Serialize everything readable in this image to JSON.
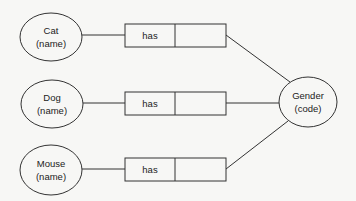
{
  "diagram": {
    "type": "entity-relationship",
    "stroke_color": "#333333",
    "background": "#f7f7f5",
    "entities": [
      {
        "id": "cat",
        "name": "Cat",
        "qualifier": "(name)",
        "cx": 51,
        "cy": 37,
        "rx": 31,
        "ry": 24
      },
      {
        "id": "dog",
        "name": "Dog",
        "qualifier": "(name)",
        "cx": 52,
        "cy": 104,
        "rx": 31,
        "ry": 24
      },
      {
        "id": "mouse",
        "name": "Mouse",
        "qualifier": "(name)",
        "cx": 51,
        "cy": 170,
        "rx": 31,
        "ry": 25
      }
    ],
    "target": {
      "id": "gender",
      "name": "Gender",
      "qualifier": "(code)",
      "cx": 308,
      "cy": 102,
      "rx": 29,
      "ry": 25
    },
    "relationships": [
      {
        "from": "cat",
        "to": "gender",
        "label": "has",
        "box_y": 24
      },
      {
        "from": "dog",
        "to": "gender",
        "label": "has",
        "box_y": 92
      },
      {
        "from": "mouse",
        "to": "gender",
        "label": "has",
        "box_y": 158
      }
    ]
  }
}
